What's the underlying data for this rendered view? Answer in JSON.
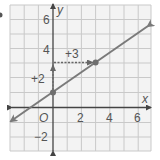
{
  "figure": {
    "part_marker": "",
    "axes": {
      "x_label": "x",
      "y_label": "y",
      "origin_label": "O",
      "x_range": [
        -3,
        7
      ],
      "y_range": [
        -3,
        7
      ],
      "x_ticks": [
        {
          "value": 2,
          "label": "2"
        },
        {
          "value": 4,
          "label": "4"
        },
        {
          "value": 6,
          "label": "6"
        }
      ],
      "y_ticks": [
        {
          "value": 6,
          "label": "6"
        },
        {
          "value": 4,
          "label": "4"
        },
        {
          "value": -2,
          "label": "−2"
        }
      ]
    },
    "line": {
      "slope": "2/3",
      "y_intercept": 1,
      "points": [
        [
          0,
          1
        ],
        [
          3,
          3
        ]
      ],
      "color": "#7a7a7a"
    },
    "annotations": {
      "rise_label": "+2",
      "run_label": "+3"
    },
    "colors": {
      "grid": "#c9c9c9",
      "background": "#f3f3f3",
      "axis": "#444444",
      "point": "#6e6e6e"
    }
  }
}
